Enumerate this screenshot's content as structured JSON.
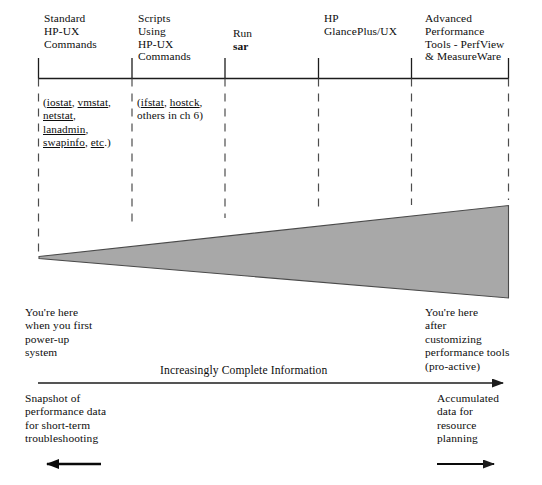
{
  "diagram": {
    "title_implicit": "HP-UX performance tool progression",
    "axis": {
      "label": "Increasingly Complete Information",
      "direction": "left-to-right"
    },
    "stages": [
      {
        "id": "standard-commands",
        "heading": "Standard\nHP-UX\nCommands",
        "commands": "(iostat, vmstat,\nnetstat,\nlanadmin,\nswapinfo, etc.)",
        "commands_underlined": [
          "iostat",
          "vmstat",
          "netstat",
          "lanadmin",
          "swapinfo",
          "etc"
        ]
      },
      {
        "id": "scripts",
        "heading": "Scripts\nUsing\nHP-UX\nCommands",
        "commands": "(ifstat, hostck,\nothers in ch 6)",
        "commands_underlined": [
          "ifstat",
          "hostck"
        ]
      },
      {
        "id": "run-sar",
        "heading_normal": "Run",
        "heading_bold": "sar",
        "commands": ""
      },
      {
        "id": "glanceplus",
        "heading": "HP\nGlancePlus/UX",
        "commands": ""
      },
      {
        "id": "advanced-tools",
        "heading": "Advanced\nPerformance\nTools - PerfView\n& MeasureWare",
        "commands": ""
      }
    ],
    "annotations": {
      "left_top": "You're here\nwhen you first\npower-up\nsystem",
      "right_top": "You're here\nafter\ncustomizing\nperformance tools\n(pro-active)",
      "left_bottom": "Snapshot of\nperformance data\nfor short-term\ntroubleshooting",
      "right_bottom": "Accumulated\ndata for\nresource\nplanning"
    },
    "colors": {
      "wedge_fill": "#a8a8a8",
      "wedge_stroke": "#4a4a4a",
      "line": "#1c1c1c",
      "text": "#0d0d0d",
      "background": "#ffffff"
    }
  }
}
